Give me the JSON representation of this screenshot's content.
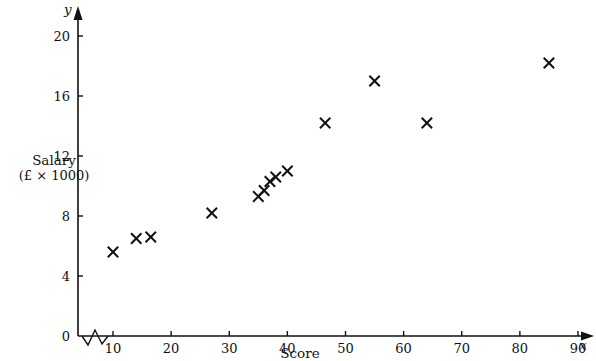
{
  "chart_data": {
    "type": "scatter",
    "title": "",
    "xlabel": "Score",
    "ylabel": "Salary (£ × 1000)",
    "ylabel_line1": "Salary",
    "ylabel_line2": "(£ × 1000)",
    "x_axis_variable": "x",
    "y_axis_variable": "y",
    "xlim": [
      5,
      92
    ],
    "ylim": [
      0,
      21
    ],
    "xticks": [
      10,
      20,
      30,
      40,
      50,
      60,
      70,
      80,
      90
    ],
    "yticks": [
      0,
      4,
      8,
      12,
      16,
      20
    ],
    "xtick_labels": [
      "10",
      "20",
      "30",
      "40",
      "50",
      "60",
      "70",
      "80",
      "90"
    ],
    "ytick_labels": [
      "0",
      "4",
      "8",
      "12",
      "16",
      "20"
    ],
    "grid": false,
    "legend": null,
    "axis_break_x": true,
    "marker_style": "x-cross",
    "marker_color": "#111111",
    "points": [
      {
        "x": 10.0,
        "y": 5.6
      },
      {
        "x": 14.0,
        "y": 6.5
      },
      {
        "x": 16.5,
        "y": 6.6
      },
      {
        "x": 27.0,
        "y": 8.2
      },
      {
        "x": 35.0,
        "y": 9.3
      },
      {
        "x": 36.0,
        "y": 9.7
      },
      {
        "x": 37.0,
        "y": 10.3
      },
      {
        "x": 38.0,
        "y": 10.6
      },
      {
        "x": 40.0,
        "y": 11.0
      },
      {
        "x": 46.5,
        "y": 14.2
      },
      {
        "x": 55.0,
        "y": 17.0
      },
      {
        "x": 64.0,
        "y": 14.2
      },
      {
        "x": 85.0,
        "y": 18.2
      }
    ]
  }
}
